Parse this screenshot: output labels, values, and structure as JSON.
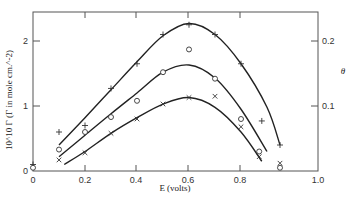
{
  "chart_data": {
    "type": "scatter",
    "title": "",
    "xlabel": "E (volts)",
    "ylabel": "10^10 Γ (Γ in mole cm.^-2)",
    "ylabel_right": "θ",
    "xlim": [
      0,
      1.0
    ],
    "ylim": [
      0,
      2.4
    ],
    "ylim_right": [
      0,
      0.24
    ],
    "x_ticks": [
      "0",
      "0.2",
      "0.4",
      "0.6",
      "0.8",
      "1.0"
    ],
    "y_ticks": [
      "0",
      "1",
      "2"
    ],
    "y_ticks_right": [
      "0.1",
      "0.2"
    ],
    "grid": false,
    "legend": "none",
    "series": [
      {
        "name": "plus",
        "marker": "+",
        "points": [
          [
            0.0,
            0.1
          ],
          [
            0.1,
            0.6
          ],
          [
            0.2,
            0.7
          ],
          [
            0.3,
            1.27
          ],
          [
            0.4,
            1.65
          ],
          [
            0.5,
            2.1
          ],
          [
            0.6,
            2.25
          ],
          [
            0.7,
            2.1
          ],
          [
            0.8,
            1.65
          ],
          [
            0.88,
            0.77
          ],
          [
            0.95,
            0.4
          ]
        ],
        "curve": [
          [
            0.1,
            0.4
          ],
          [
            0.2,
            0.82
          ],
          [
            0.3,
            1.25
          ],
          [
            0.4,
            1.68
          ],
          [
            0.5,
            2.08
          ],
          [
            0.6,
            2.27
          ],
          [
            0.7,
            2.1
          ],
          [
            0.8,
            1.65
          ],
          [
            0.9,
            0.98
          ],
          [
            0.95,
            0.4
          ]
        ]
      },
      {
        "name": "circle",
        "marker": "o",
        "points": [
          [
            0.0,
            0.05
          ],
          [
            0.1,
            0.33
          ],
          [
            0.2,
            0.6
          ],
          [
            0.3,
            0.83
          ],
          [
            0.4,
            1.08
          ],
          [
            0.5,
            1.52
          ],
          [
            0.6,
            1.87
          ],
          [
            0.7,
            1.42
          ],
          [
            0.8,
            0.8
          ],
          [
            0.87,
            0.3
          ],
          [
            0.95,
            0.05
          ]
        ],
        "curve": [
          [
            0.1,
            0.22
          ],
          [
            0.2,
            0.55
          ],
          [
            0.3,
            0.88
          ],
          [
            0.4,
            1.2
          ],
          [
            0.5,
            1.52
          ],
          [
            0.6,
            1.63
          ],
          [
            0.7,
            1.43
          ],
          [
            0.8,
            0.95
          ],
          [
            0.9,
            0.3
          ]
        ]
      },
      {
        "name": "cross",
        "marker": "x",
        "points": [
          [
            0.1,
            0.17
          ],
          [
            0.2,
            0.28
          ],
          [
            0.3,
            0.58
          ],
          [
            0.4,
            0.8
          ],
          [
            0.5,
            1.03
          ],
          [
            0.6,
            1.13
          ],
          [
            0.7,
            1.15
          ],
          [
            0.8,
            0.68
          ],
          [
            0.87,
            0.22
          ],
          [
            0.95,
            0.12
          ]
        ],
        "curve": [
          [
            0.12,
            0.1
          ],
          [
            0.2,
            0.3
          ],
          [
            0.3,
            0.58
          ],
          [
            0.4,
            0.82
          ],
          [
            0.5,
            1.03
          ],
          [
            0.6,
            1.13
          ],
          [
            0.7,
            0.98
          ],
          [
            0.8,
            0.6
          ],
          [
            0.88,
            0.15
          ]
        ]
      }
    ]
  }
}
